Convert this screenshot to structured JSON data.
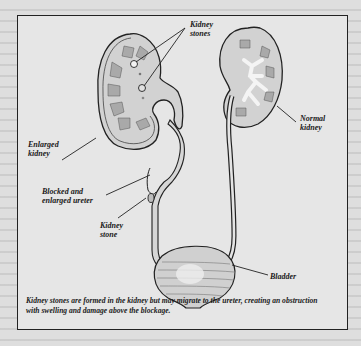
{
  "figure": {
    "labels": {
      "kidney_stones": [
        "Kidney",
        "stones"
      ],
      "normal_kidney": [
        "Normal",
        "kidney"
      ],
      "enlarged_kidney": [
        "Enlarged",
        "kidney"
      ],
      "blocked_ureter": [
        "Blocked and",
        "enlarged ureter"
      ],
      "kidney_stone": [
        "Kidney",
        "stone"
      ],
      "bladder": "Bladder"
    },
    "caption": "Kidney stones are formed in the kidney but may migrate to the ureter, creating an obstruction with swelling and damage above the blockage."
  },
  "colors": {
    "page_background": "#dedede",
    "figure_background": "#e6e6e6",
    "line": "#222222",
    "tissue": "#c9c9c9",
    "pyramid": "#a9a9a9"
  }
}
